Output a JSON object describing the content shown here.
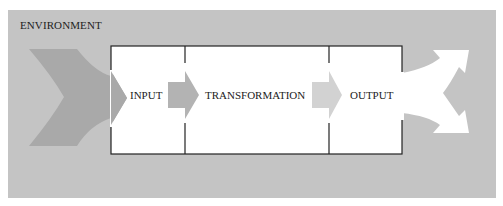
{
  "diagram": {
    "environment_label": "ENVIRONMENT",
    "stages": [
      {
        "id": "input",
        "label": "INPUT"
      },
      {
        "id": "transformation",
        "label": "TRANSFORMATION"
      },
      {
        "id": "output",
        "label": "OUTPUT"
      }
    ],
    "colors": {
      "environment": "#c4c4c4",
      "inflow_arrow": "#a9a9a9",
      "inner_arrow_1": "#b3b3b3",
      "inner_arrow_2": "#d2d2d2",
      "outflow_arrow": "#ffffff",
      "box_border": "#222222",
      "box_fill": "#ffffff"
    }
  }
}
